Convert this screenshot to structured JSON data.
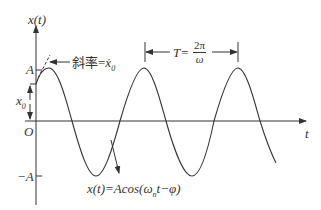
{
  "axes": {
    "y_label": "x(t)",
    "x_label": "t",
    "origin_label": "O",
    "amplitude_label": "A",
    "neg_amplitude_label": "−A",
    "initial_label": "x",
    "initial_sub": "0"
  },
  "annotations": {
    "slope_label": "斜率=",
    "slope_symbol": "ẋ",
    "slope_sub": "0",
    "period_prefix": "T=",
    "period_num": "2π",
    "period_den": "ω",
    "equation_prefix": "x(t)=Acos(ω",
    "equation_sub": "n",
    "equation_suffix": "t−φ)"
  },
  "colors": {
    "stroke": "#333333",
    "background": "#ffffff"
  }
}
